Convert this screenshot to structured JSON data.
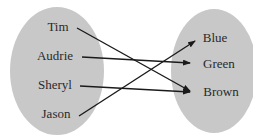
{
  "diagram": {
    "type": "mapping",
    "domain": {
      "label": "domain-set",
      "items": [
        "Tim",
        "Audrie",
        "Sheryl",
        "Jason"
      ]
    },
    "range": {
      "label": "range-set",
      "items": [
        "Blue",
        "Green",
        "Brown"
      ]
    },
    "mappings": [
      {
        "from": "Tim",
        "to": "Brown"
      },
      {
        "from": "Audrie",
        "to": "Green"
      },
      {
        "from": "Sheryl",
        "to": "Brown"
      },
      {
        "from": "Jason",
        "to": "Blue"
      }
    ],
    "colors": {
      "oval_fill": "#c8c8c8",
      "arrow": "#1a1a1a",
      "text": "#2a2a2a"
    }
  }
}
